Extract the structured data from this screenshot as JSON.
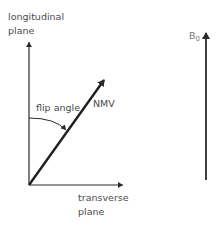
{
  "diagram": {
    "axes": {
      "vertical_label_line1": "longitudinal",
      "vertical_label_line2": "plane",
      "horizontal_label_line1": "transverse",
      "horizontal_label_line2": "plane"
    },
    "vector": {
      "label": "NMV"
    },
    "angle": {
      "label": "flip angle"
    },
    "field": {
      "label_main": "B",
      "label_sub": "0"
    },
    "colors": {
      "stroke": "#2b2b2b",
      "text": "#4a4a4a",
      "field_text": "#7a7a7a"
    }
  }
}
